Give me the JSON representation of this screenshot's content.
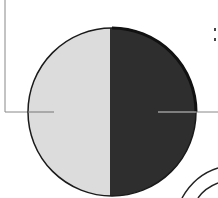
{
  "diagram": {
    "type": "half-illuminated-sphere",
    "colors": {
      "background": "#ffffff",
      "light_half": "#dcdcdc",
      "dark_half": "#2e2e2e",
      "outline": "#1a1a1a",
      "leader_line": "#888888",
      "arc": "#222222"
    },
    "shapes": {
      "circle": {
        "cx": 112,
        "cy": 112,
        "r": 84
      },
      "split_x": 110,
      "left_leader": {
        "from": [
          5,
          0
        ],
        "corner": [
          5,
          112
        ],
        "to": [
          54,
          112
        ]
      },
      "right_leader": {
        "from": [
          158,
          112
        ],
        "to": [
          218,
          112
        ]
      },
      "arcs": [
        "outer-arc",
        "inner-arc"
      ]
    },
    "labels": {
      "partial_marks": ":"
    }
  }
}
